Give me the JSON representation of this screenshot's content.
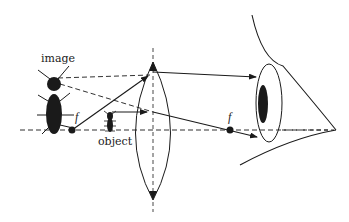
{
  "diagram": {
    "labels": {
      "image": "image",
      "object": "object",
      "focal_left": "f",
      "focal_right": "f"
    },
    "elements": {
      "optical_axis": "horizontal dashed principal axis",
      "lens": "biconvex converging lens",
      "eye": "eye with pupil and iris",
      "object": "small upright insect (ant) inside focal length",
      "image": "large upright virtual image of insect",
      "focal_points": [
        "left focal point",
        "right focal point"
      ]
    },
    "colors": {
      "ink": "#1a1a1a",
      "background": "#ffffff"
    }
  }
}
